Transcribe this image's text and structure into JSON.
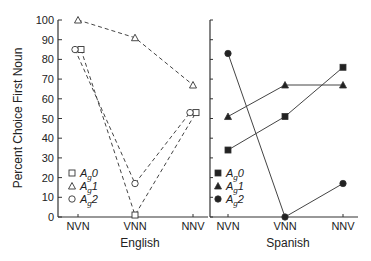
{
  "chart_data": [
    {
      "type": "line",
      "title": "English",
      "xlabel": "English",
      "ylabel": "Percent Choice First Noun",
      "ylim": [
        0,
        100
      ],
      "yticks": [
        0,
        10,
        20,
        30,
        40,
        50,
        60,
        70,
        80,
        90,
        100
      ],
      "categories": [
        "NVN",
        "VNN",
        "NNV"
      ],
      "line_style": "dashed",
      "marker_fill": "open",
      "series": [
        {
          "name": "Ag0",
          "marker": "square",
          "values": [
            85,
            1,
            53
          ]
        },
        {
          "name": "Ag1",
          "marker": "triangle",
          "values": [
            100,
            91,
            67
          ]
        },
        {
          "name": "Ag2",
          "marker": "circle",
          "values": [
            85,
            17,
            53
          ]
        }
      ],
      "legend_position": "lower-left"
    },
    {
      "type": "line",
      "title": "Spanish",
      "xlabel": "Spanish",
      "ylim": [
        0,
        100
      ],
      "categories": [
        "NVN",
        "VNN",
        "NNV"
      ],
      "line_style": "solid",
      "marker_fill": "filled",
      "series": [
        {
          "name": "Ag0",
          "marker": "square",
          "values": [
            34,
            51,
            76
          ]
        },
        {
          "name": "Ag1",
          "marker": "triangle",
          "values": [
            51,
            67,
            67
          ]
        },
        {
          "name": "Ag2",
          "marker": "circle",
          "values": [
            83,
            0,
            17
          ]
        }
      ],
      "legend_position": "lower-left"
    }
  ],
  "labels": {
    "ylabel": "Percent Choice First Noun",
    "panel1": "English",
    "panel2": "Spanish",
    "legend": [
      {
        "base": "A",
        "sub": "g",
        "suffix": "0"
      },
      {
        "base": "A",
        "sub": "g",
        "suffix": "1"
      },
      {
        "base": "A",
        "sub": "g",
        "suffix": "2"
      }
    ]
  }
}
